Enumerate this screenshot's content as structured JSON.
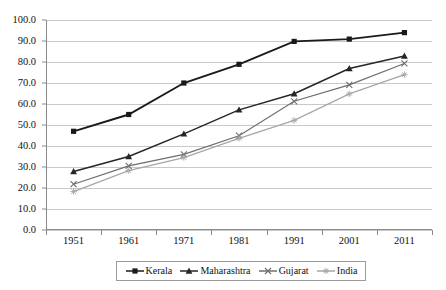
{
  "chart_data": {
    "type": "line",
    "title": "",
    "xlabel": "",
    "ylabel": "",
    "categories": [
      "1951",
      "1961",
      "1971",
      "1981",
      "1991",
      "2001",
      "2011"
    ],
    "ylim": [
      0,
      100
    ],
    "ytick_step": 10,
    "ytick_labels": [
      "0.0",
      "10.0",
      "20.0",
      "30.0",
      "40.0",
      "50.0",
      "60.0",
      "70.0",
      "80.0",
      "90.0",
      "100.0"
    ],
    "grid": true,
    "legend_position": "bottom",
    "series": [
      {
        "name": "Kerala",
        "marker": "filled-square",
        "color": "#1a1a1a",
        "values": [
          47.0,
          55.0,
          70.0,
          78.9,
          89.8,
          90.9,
          94.0
        ]
      },
      {
        "name": "Maharashtra",
        "marker": "filled-triangle",
        "color": "#262626",
        "values": [
          27.9,
          35.0,
          45.8,
          57.2,
          64.9,
          76.9,
          82.9
        ]
      },
      {
        "name": "Gujarat",
        "marker": "cross",
        "color": "#6e6e6e",
        "values": [
          21.8,
          30.5,
          36.0,
          44.9,
          61.3,
          69.1,
          79.3
        ]
      },
      {
        "name": "India",
        "marker": "star",
        "color": "#a6a6a6",
        "values": [
          18.3,
          28.3,
          34.5,
          43.6,
          52.2,
          64.8,
          74.0
        ]
      }
    ]
  }
}
